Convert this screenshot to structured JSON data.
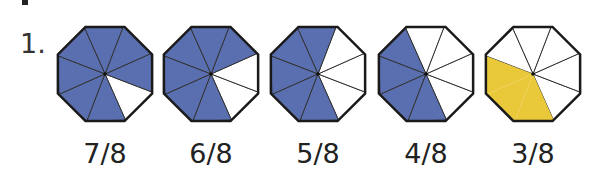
{
  "problem": {
    "number": "1."
  },
  "colors": {
    "shaded_blue": "#5a6fb0",
    "shaded_yellow": "#e9c93a",
    "outline": "#1a1a1a",
    "empty": "#ffffff"
  },
  "octagons": [
    {
      "label": "7/8",
      "shaded": 7,
      "total": 8,
      "color": "blue",
      "cx": 105
    },
    {
      "label": "6/8",
      "shaded": 6,
      "total": 8,
      "color": "blue",
      "cx": 211
    },
    {
      "label": "5/8",
      "shaded": 5,
      "total": 8,
      "color": "blue",
      "cx": 318
    },
    {
      "label": "4/8",
      "shaded": 4,
      "total": 8,
      "color": "blue",
      "cx": 426
    },
    {
      "label": "3/8",
      "shaded": 3,
      "total": 8,
      "color": "yellow",
      "cx": 533
    }
  ]
}
